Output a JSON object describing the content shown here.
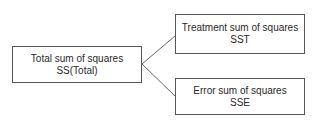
{
  "diagram": {
    "root": {
      "line1": "Total sum of squares",
      "line2": "SS(Total)"
    },
    "children": [
      {
        "line1": "Treatment sum of squares",
        "line2": "SST"
      },
      {
        "line1": "Error sum of squares",
        "line2": "SSE"
      }
    ],
    "colors": {
      "stroke": "#555555",
      "text": "#2a2a2a",
      "background": "#ffffff"
    }
  }
}
